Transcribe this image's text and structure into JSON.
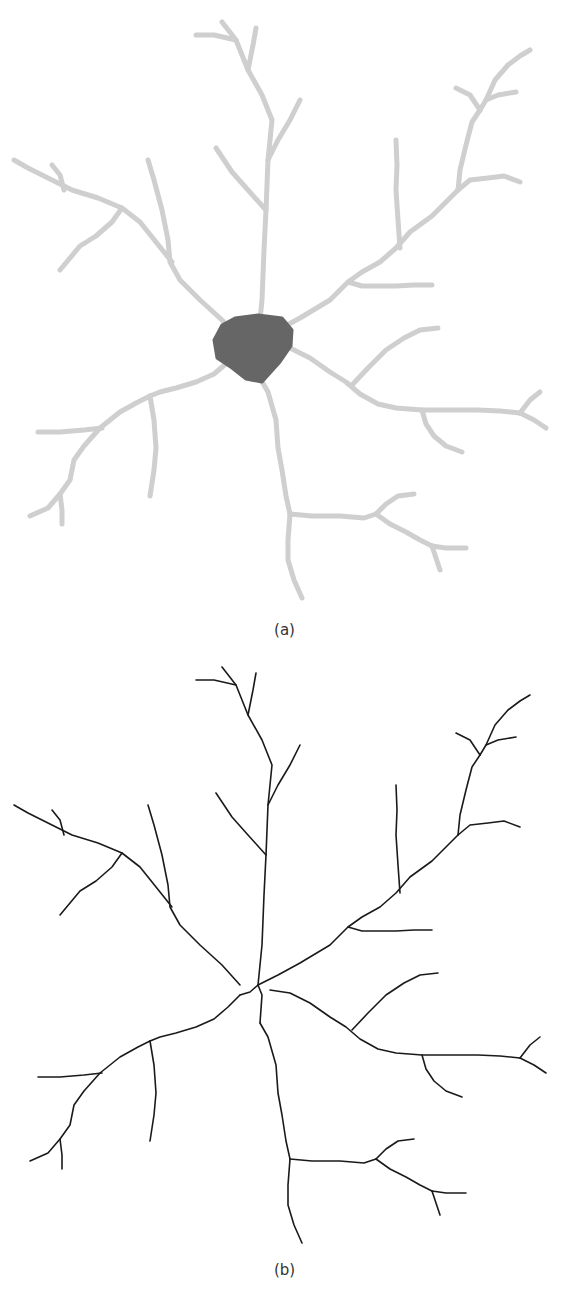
{
  "figure": {
    "panels": [
      {
        "id": "a",
        "caption": "(a)",
        "description": "Segmented neuron: dark soma with light gray dendritic arbor",
        "dendrite_color": "#cfcfcf",
        "soma_color": "#666666"
      },
      {
        "id": "b",
        "caption": "(b)",
        "description": "Skeletonized neuron: thin black centerline tracing",
        "line_color": "#1a1a1a"
      }
    ],
    "soma": {
      "points": [
        [
          222,
          325
        ],
        [
          235,
          318
        ],
        [
          258,
          315
        ],
        [
          282,
          318
        ],
        [
          292,
          330
        ],
        [
          291,
          346
        ],
        [
          280,
          362
        ],
        [
          262,
          382
        ],
        [
          246,
          379
        ],
        [
          232,
          368
        ],
        [
          217,
          358
        ],
        [
          214,
          340
        ]
      ]
    },
    "branches": [
      [
        [
          258,
          340
        ],
        [
          262,
          300
        ],
        [
          264,
          250
        ],
        [
          266,
          210
        ],
        [
          268,
          160
        ],
        [
          272,
          120
        ],
        [
          262,
          95
        ],
        [
          248,
          70
        ],
        [
          236,
          40
        ],
        [
          222,
          22
        ]
      ],
      [
        [
          236,
          40
        ],
        [
          214,
          35
        ],
        [
          196,
          35
        ]
      ],
      [
        [
          248,
          70
        ],
        [
          253,
          45
        ],
        [
          256,
          28
        ]
      ],
      [
        [
          268,
          160
        ],
        [
          278,
          140
        ],
        [
          290,
          120
        ],
        [
          300,
          100
        ]
      ],
      [
        [
          266,
          210
        ],
        [
          248,
          190
        ],
        [
          232,
          172
        ],
        [
          216,
          148
        ]
      ],
      [
        [
          240,
          340
        ],
        [
          222,
          320
        ],
        [
          200,
          300
        ],
        [
          180,
          280
        ],
        [
          170,
          262
        ],
        [
          168,
          240
        ],
        [
          162,
          210
        ],
        [
          154,
          180
        ],
        [
          148,
          160
        ]
      ],
      [
        [
          172,
          262
        ],
        [
          156,
          242
        ],
        [
          140,
          222
        ],
        [
          122,
          208
        ],
        [
          98,
          198
        ],
        [
          72,
          190
        ],
        [
          48,
          178
        ],
        [
          28,
          168
        ],
        [
          14,
          160
        ]
      ],
      [
        [
          64,
          190
        ],
        [
          60,
          175
        ],
        [
          52,
          165
        ]
      ],
      [
        [
          122,
          208
        ],
        [
          112,
          222
        ],
        [
          96,
          236
        ],
        [
          80,
          246
        ],
        [
          60,
          270
        ]
      ],
      [
        [
          258,
          340
        ],
        [
          278,
          330
        ],
        [
          300,
          318
        ],
        [
          330,
          300
        ],
        [
          348,
          282
        ],
        [
          362,
          272
        ],
        [
          380,
          262
        ],
        [
          396,
          248
        ],
        [
          410,
          232
        ],
        [
          432,
          216
        ],
        [
          458,
          190
        ]
      ],
      [
        [
          348,
          282
        ],
        [
          362,
          286
        ],
        [
          380,
          286
        ],
        [
          396,
          286
        ],
        [
          414,
          285
        ],
        [
          432,
          285
        ]
      ],
      [
        [
          400,
          248
        ],
        [
          398,
          220
        ],
        [
          396,
          190
        ],
        [
          397,
          165
        ],
        [
          396,
          140
        ]
      ],
      [
        [
          458,
          190
        ],
        [
          470,
          180
        ],
        [
          488,
          178
        ],
        [
          504,
          176
        ],
        [
          520,
          182
        ]
      ],
      [
        [
          458,
          190
        ],
        [
          460,
          170
        ],
        [
          466,
          145
        ],
        [
          472,
          122
        ],
        [
          480,
          110
        ]
      ],
      [
        [
          480,
          110
        ],
        [
          470,
          95
        ],
        [
          456,
          88
        ]
      ],
      [
        [
          480,
          110
        ],
        [
          486,
          100
        ],
        [
          498,
          95
        ],
        [
          516,
          92
        ]
      ],
      [
        [
          486,
          100
        ],
        [
          495,
          80
        ],
        [
          508,
          65
        ],
        [
          520,
          56
        ],
        [
          530,
          50
        ]
      ],
      [
        [
          270,
          345
        ],
        [
          290,
          348
        ],
        [
          310,
          358
        ],
        [
          330,
          372
        ],
        [
          346,
          382
        ],
        [
          360,
          394
        ],
        [
          378,
          404
        ],
        [
          396,
          408
        ],
        [
          422,
          410
        ],
        [
          450,
          410
        ],
        [
          478,
          410
        ],
        [
          500,
          411
        ],
        [
          520,
          413
        ]
      ],
      [
        [
          520,
          413
        ],
        [
          530,
          400
        ],
        [
          540,
          392
        ]
      ],
      [
        [
          520,
          413
        ],
        [
          534,
          420
        ],
        [
          546,
          428
        ]
      ],
      [
        [
          352,
          385
        ],
        [
          368,
          368
        ],
        [
          386,
          350
        ],
        [
          404,
          338
        ],
        [
          420,
          330
        ],
        [
          438,
          328
        ]
      ],
      [
        [
          422,
          410
        ],
        [
          426,
          424
        ],
        [
          434,
          436
        ],
        [
          446,
          446
        ],
        [
          462,
          452
        ]
      ],
      [
        [
          240,
          350
        ],
        [
          228,
          362
        ],
        [
          214,
          374
        ],
        [
          196,
          382
        ],
        [
          176,
          388
        ],
        [
          160,
          392
        ],
        [
          150,
          396
        ]
      ],
      [
        [
          150,
          396
        ],
        [
          138,
          402
        ],
        [
          120,
          412
        ],
        [
          100,
          428
        ],
        [
          84,
          446
        ],
        [
          74,
          460
        ],
        [
          70,
          480
        ],
        [
          60,
          494
        ],
        [
          48,
          508
        ],
        [
          30,
          516
        ]
      ],
      [
        [
          102,
          428
        ],
        [
          84,
          430
        ],
        [
          60,
          432
        ],
        [
          38,
          432
        ]
      ],
      [
        [
          60,
          494
        ],
        [
          62,
          510
        ],
        [
          62,
          524
        ]
      ],
      [
        [
          150,
          396
        ],
        [
          154,
          420
        ],
        [
          156,
          448
        ],
        [
          154,
          470
        ],
        [
          150,
          496
        ]
      ],
      [
        [
          260,
          378
        ],
        [
          268,
          392
        ],
        [
          276,
          420
        ],
        [
          278,
          448
        ],
        [
          282,
          470
        ],
        [
          286,
          496
        ],
        [
          290,
          514
        ]
      ],
      [
        [
          290,
          514
        ],
        [
          288,
          540
        ],
        [
          288,
          560
        ],
        [
          294,
          580
        ],
        [
          302,
          598
        ]
      ],
      [
        [
          290,
          514
        ],
        [
          312,
          516
        ],
        [
          340,
          516
        ],
        [
          364,
          518
        ],
        [
          376,
          514
        ]
      ],
      [
        [
          376,
          514
        ],
        [
          386,
          504
        ],
        [
          398,
          496
        ],
        [
          414,
          494
        ]
      ],
      [
        [
          376,
          514
        ],
        [
          390,
          524
        ],
        [
          406,
          532
        ],
        [
          420,
          540
        ],
        [
          432,
          546
        ]
      ],
      [
        [
          432,
          546
        ],
        [
          446,
          548
        ],
        [
          466,
          548
        ]
      ],
      [
        [
          432,
          546
        ],
        [
          436,
          558
        ],
        [
          440,
          570
        ]
      ]
    ]
  }
}
